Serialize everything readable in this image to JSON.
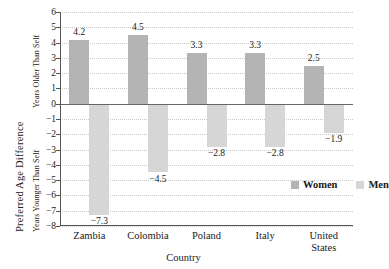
{
  "chart_data": {
    "type": "bar",
    "title": "",
    "xlabel": "Country",
    "ylabel": "Preferred Age Difference",
    "ylabel_upper": "Years Older Than Self",
    "ylabel_lower": "Years Younger Than Self",
    "categories": [
      "Zambia",
      "Colombia",
      "Poland",
      "Italy",
      "United States"
    ],
    "series": [
      {
        "name": "Women",
        "color": "#b4b4b4",
        "values": [
          4.2,
          4.5,
          3.3,
          3.3,
          2.5
        ],
        "labels": [
          "4.2",
          "4.5",
          "3.3",
          "3.3",
          "2.5"
        ]
      },
      {
        "name": "Men",
        "color": "#d6d6d6",
        "values": [
          -7.3,
          -4.5,
          -2.8,
          -2.8,
          -1.9
        ],
        "labels": [
          "−7.3",
          "−4.5",
          "−2.8",
          "−2.8",
          "−1.9"
        ]
      }
    ],
    "ylim": [
      -8,
      6
    ],
    "yticks": [
      6,
      5,
      4,
      3,
      2,
      1,
      0,
      -1,
      -2,
      -3,
      -4,
      -5,
      -6,
      -7,
      -8
    ],
    "ytick_labels": [
      "6",
      "5",
      "4",
      "3",
      "2",
      "1",
      "0",
      "−1",
      "−2",
      "−3",
      "−4",
      "−5",
      "−6",
      "−7",
      "−8"
    ],
    "grid": true,
    "legend_position": "inside-lower-right",
    "legend": [
      "Women",
      "Men"
    ]
  }
}
